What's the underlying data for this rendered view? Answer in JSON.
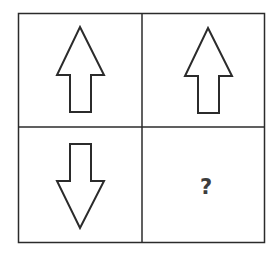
{
  "puzzle": {
    "cells": [
      {
        "position": "top-left",
        "shape": "arrow-up"
      },
      {
        "position": "top-right",
        "shape": "arrow-up"
      },
      {
        "position": "bottom-left",
        "shape": "arrow-down"
      },
      {
        "position": "bottom-right",
        "shape": "question",
        "text": "?"
      }
    ],
    "colors": {
      "stroke": "#2b2b2b",
      "fill": "#ffffff",
      "question": "#3d3d3d"
    }
  }
}
